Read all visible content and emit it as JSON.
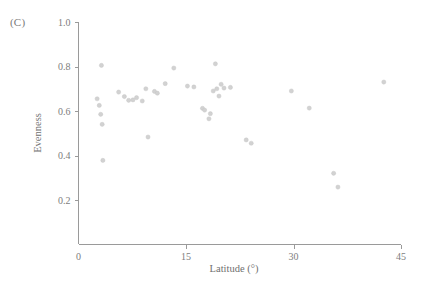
{
  "panel": {
    "label": "(C)"
  },
  "chart_data": {
    "type": "scatter",
    "title": "",
    "xlabel": "Latitude (°)",
    "ylabel": "Evenness",
    "xlim": [
      0,
      45
    ],
    "ylim": [
      0,
      1.0
    ],
    "xticks": [
      0,
      15,
      30,
      45
    ],
    "xtick_labels": [
      "0",
      "15",
      "30",
      "45"
    ],
    "yticks": [
      0.2,
      0.4,
      0.6,
      0.8,
      1.0
    ],
    "ytick_labels": [
      "0.2",
      "0.4",
      "0.6",
      "0.8",
      "1.0"
    ],
    "grid": false,
    "legend": false,
    "marker_color": "#d2d2d2",
    "series": [
      {
        "name": "sites",
        "points": [
          {
            "x": 3.2,
            "y": 0.805
          },
          {
            "x": 2.6,
            "y": 0.655
          },
          {
            "x": 2.9,
            "y": 0.625
          },
          {
            "x": 3.1,
            "y": 0.585
          },
          {
            "x": 3.3,
            "y": 0.54
          },
          {
            "x": 3.4,
            "y": 0.378
          },
          {
            "x": 5.6,
            "y": 0.685
          },
          {
            "x": 6.4,
            "y": 0.665
          },
          {
            "x": 7.0,
            "y": 0.648
          },
          {
            "x": 7.6,
            "y": 0.65
          },
          {
            "x": 8.1,
            "y": 0.66
          },
          {
            "x": 8.9,
            "y": 0.645
          },
          {
            "x": 9.4,
            "y": 0.7
          },
          {
            "x": 9.7,
            "y": 0.483
          },
          {
            "x": 10.6,
            "y": 0.688
          },
          {
            "x": 11.0,
            "y": 0.68
          },
          {
            "x": 12.1,
            "y": 0.723
          },
          {
            "x": 13.3,
            "y": 0.793
          },
          {
            "x": 15.2,
            "y": 0.712
          },
          {
            "x": 16.1,
            "y": 0.708
          },
          {
            "x": 17.3,
            "y": 0.612
          },
          {
            "x": 17.6,
            "y": 0.604
          },
          {
            "x": 18.2,
            "y": 0.565
          },
          {
            "x": 18.4,
            "y": 0.588
          },
          {
            "x": 18.8,
            "y": 0.69
          },
          {
            "x": 19.1,
            "y": 0.812
          },
          {
            "x": 19.3,
            "y": 0.7
          },
          {
            "x": 19.6,
            "y": 0.667
          },
          {
            "x": 19.9,
            "y": 0.72
          },
          {
            "x": 20.3,
            "y": 0.703
          },
          {
            "x": 21.2,
            "y": 0.706
          },
          {
            "x": 23.4,
            "y": 0.47
          },
          {
            "x": 24.1,
            "y": 0.455
          },
          {
            "x": 29.7,
            "y": 0.69
          },
          {
            "x": 32.2,
            "y": 0.613
          },
          {
            "x": 35.6,
            "y": 0.32
          },
          {
            "x": 36.2,
            "y": 0.258
          },
          {
            "x": 42.6,
            "y": 0.73
          }
        ]
      }
    ]
  }
}
